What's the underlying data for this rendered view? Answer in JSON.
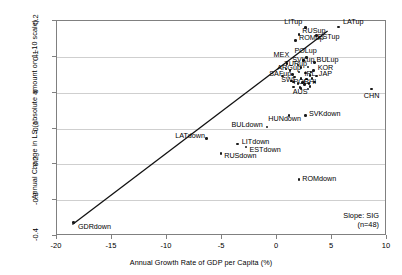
{
  "chart_data": {
    "type": "scatter",
    "title": "",
    "xlabel": "Annual Growth Rate of GDP per Capita (%)",
    "ylabel": "Annual Change in LS (absolute amount on 1–10 scale)",
    "xlim": [
      -20,
      10
    ],
    "ylim": [
      -0.4,
      0.2
    ],
    "xticks": [
      "-20",
      "-15",
      "-10",
      "-5",
      "0",
      "5",
      "10"
    ],
    "xtick_values": [
      -20,
      -15,
      -10,
      -5,
      0,
      5,
      10
    ],
    "yticks": [
      "0.2",
      "0.1",
      "0",
      "-0.1",
      "-0.2",
      "-0.3",
      "-0.4"
    ],
    "ytick_values": [
      0.2,
      0.1,
      0,
      -0.1,
      -0.2,
      -0.3,
      -0.4
    ],
    "grid": true,
    "grid_axis": "y",
    "legend": false,
    "marker": "filled-circle",
    "annotation": {
      "line1": "Slope: SIG",
      "line2": "(n=48)",
      "position": "bottom-right"
    },
    "trendline": {
      "visible": true,
      "x0": -18.6,
      "y0": -0.368,
      "x1": 4.6,
      "y1": 0.172
    },
    "points": [
      {
        "label": "LITup",
        "x": 2.6,
        "y": 0.182,
        "lx": 2.3,
        "ly": 0.196,
        "anchor": "right"
      },
      {
        "label": "LATup",
        "x": 5.6,
        "y": 0.183,
        "lx": 6.0,
        "ly": 0.196,
        "anchor": "left"
      },
      {
        "label": "RUSup",
        "x": 2.0,
        "y": 0.163,
        "lx": 2.3,
        "ly": 0.173,
        "anchor": "left"
      },
      {
        "label": "ESTup",
        "x": 3.6,
        "y": 0.16,
        "lx": 3.7,
        "ly": 0.155,
        "anchor": "left"
      },
      {
        "label": "ROMup",
        "x": 1.7,
        "y": 0.146,
        "lx": 2.0,
        "ly": 0.152,
        "anchor": "left"
      },
      {
        "label": "POLup",
        "x": 2.7,
        "y": 0.098,
        "lx": 2.6,
        "ly": 0.115,
        "anchor": "center"
      },
      {
        "label": "MEX",
        "x": 0.9,
        "y": 0.082,
        "lx": 0.4,
        "ly": 0.104,
        "anchor": "center"
      },
      {
        "label": "SVKup",
        "x": 2.4,
        "y": 0.089,
        "lx": 2.4,
        "ly": 0.09,
        "anchor": "center"
      },
      {
        "label": "BULup",
        "x": 3.4,
        "y": 0.085,
        "lx": 3.6,
        "ly": 0.09,
        "anchor": "left"
      },
      {
        "label": "TURup",
        "x": 1.9,
        "y": 0.077,
        "lx": 1.7,
        "ly": 0.079,
        "anchor": "center"
      },
      {
        "label": "ARGup",
        "x": 1.2,
        "y": 0.062,
        "lx": 1.1,
        "ly": 0.068,
        "anchor": "center"
      },
      {
        "label": "KOR",
        "x": 3.3,
        "y": 0.062,
        "lx": 3.7,
        "ly": 0.068,
        "anchor": "left"
      },
      {
        "label": "SAFup",
        "x": 0.5,
        "y": 0.046,
        "lx": 0.3,
        "ly": 0.051,
        "anchor": "center"
      },
      {
        "label": "IRL",
        "x": 3.0,
        "y": 0.048,
        "lx": 3.0,
        "ly": 0.051,
        "anchor": "center"
      },
      {
        "label": "JAP",
        "x": 3.6,
        "y": 0.046,
        "lx": 3.8,
        "ly": 0.051,
        "anchor": "left"
      },
      {
        "label": "POR",
        "x": 2.3,
        "y": 0.028,
        "lx": 2.2,
        "ly": 0.029,
        "anchor": "center"
      },
      {
        "label": "CHI",
        "x": 2.9,
        "y": 0.026,
        "lx": 3.0,
        "ly": 0.029,
        "anchor": "center"
      },
      {
        "label": "SWI",
        "x": 1.5,
        "y": 0.03,
        "lx": 1.0,
        "ly": 0.034,
        "anchor": "center"
      },
      {
        "label": "AUS",
        "x": 2.1,
        "y": 0.015,
        "lx": 2.1,
        "ly": 0.003,
        "anchor": "center"
      },
      {
        "label": "CHN",
        "x": 8.6,
        "y": 0.01,
        "lx": 8.6,
        "ly": -0.008,
        "anchor": "center"
      },
      {
        "label": "SVKdown",
        "x": 2.6,
        "y": -0.063,
        "lx": 2.9,
        "ly": -0.06,
        "anchor": "left"
      },
      {
        "label": "HUNdown",
        "x": 1.1,
        "y": -0.063,
        "lx": 0.7,
        "ly": -0.074,
        "anchor": "center"
      },
      {
        "label": "BULdown",
        "x": -0.9,
        "y": -0.096,
        "lx": -1.3,
        "ly": -0.09,
        "anchor": "right"
      },
      {
        "label": "LATdown",
        "x": -6.4,
        "y": -0.128,
        "lx": -7.9,
        "ly": -0.122,
        "anchor": "center"
      },
      {
        "label": "LITdown",
        "x": -3.6,
        "y": -0.143,
        "lx": -3.2,
        "ly": -0.138,
        "anchor": "left"
      },
      {
        "label": "ESTdown",
        "x": -2.8,
        "y": -0.152,
        "lx": -2.5,
        "ly": -0.16,
        "anchor": "left"
      },
      {
        "label": "RUSdown",
        "x": -5.1,
        "y": -0.17,
        "lx": -4.8,
        "ly": -0.178,
        "anchor": "left"
      },
      {
        "label": "ROMdown",
        "x": 2.0,
        "y": -0.243,
        "lx": 2.3,
        "ly": -0.24,
        "anchor": "left"
      },
      {
        "label": "GDRdown",
        "x": -18.5,
        "y": -0.362,
        "lx": -18.1,
        "ly": -0.376,
        "anchor": "left"
      },
      {
        "label": "",
        "x": 2.2,
        "y": 0.07,
        "lx": 0,
        "ly": 0,
        "anchor": "none"
      },
      {
        "label": "",
        "x": 2.8,
        "y": 0.072,
        "lx": 0,
        "ly": 0,
        "anchor": "none"
      },
      {
        "label": "",
        "x": 2.0,
        "y": 0.058,
        "lx": 0,
        "ly": 0,
        "anchor": "none"
      },
      {
        "label": "",
        "x": 2.6,
        "y": 0.055,
        "lx": 0,
        "ly": 0,
        "anchor": "none"
      },
      {
        "label": "",
        "x": 3.1,
        "y": 0.058,
        "lx": 0,
        "ly": 0,
        "anchor": "none"
      },
      {
        "label": "",
        "x": 1.6,
        "y": 0.044,
        "lx": 0,
        "ly": 0,
        "anchor": "none"
      },
      {
        "label": "",
        "x": 2.2,
        "y": 0.04,
        "lx": 0,
        "ly": 0,
        "anchor": "none"
      },
      {
        "label": "",
        "x": 2.7,
        "y": 0.038,
        "lx": 0,
        "ly": 0,
        "anchor": "none"
      },
      {
        "label": "",
        "x": 3.2,
        "y": 0.04,
        "lx": 0,
        "ly": 0,
        "anchor": "none"
      },
      {
        "label": "",
        "x": 1.3,
        "y": 0.032,
        "lx": 0,
        "ly": 0,
        "anchor": "none"
      },
      {
        "label": "",
        "x": 1.9,
        "y": 0.026,
        "lx": 0,
        "ly": 0,
        "anchor": "none"
      },
      {
        "label": "",
        "x": 2.5,
        "y": 0.022,
        "lx": 0,
        "ly": 0,
        "anchor": "none"
      },
      {
        "label": "",
        "x": 3.0,
        "y": 0.018,
        "lx": 0,
        "ly": 0,
        "anchor": "none"
      },
      {
        "label": "",
        "x": 1.5,
        "y": 0.016,
        "lx": 0,
        "ly": 0,
        "anchor": "none"
      },
      {
        "label": "",
        "x": 2.2,
        "y": 0.012,
        "lx": 0,
        "ly": 0,
        "anchor": "none"
      },
      {
        "label": "",
        "x": 2.8,
        "y": 0.01,
        "lx": 0,
        "ly": 0,
        "anchor": "none"
      },
      {
        "label": "",
        "x": 0.8,
        "y": 0.066,
        "lx": 0,
        "ly": 0,
        "anchor": "none"
      },
      {
        "label": "",
        "x": 1.4,
        "y": 0.05,
        "lx": 0,
        "ly": 0,
        "anchor": "none"
      },
      {
        "label": "",
        "x": 3.4,
        "y": 0.03,
        "lx": 0,
        "ly": 0,
        "anchor": "none"
      }
    ]
  }
}
